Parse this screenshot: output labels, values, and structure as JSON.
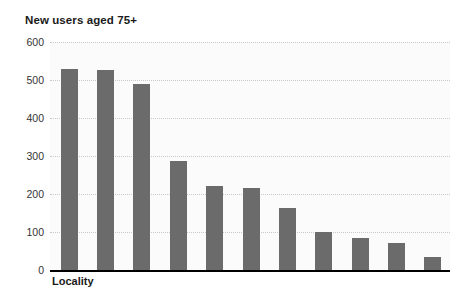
{
  "chart_data": {
    "type": "bar",
    "title": "New users aged 75+",
    "xlabel": "Locality",
    "ylabel": "",
    "categories": [
      "1",
      "2",
      "3",
      "4",
      "5",
      "6",
      "7",
      "8",
      "9",
      "10",
      "11"
    ],
    "values": [
      530,
      527,
      490,
      288,
      222,
      215,
      163,
      101,
      84,
      70,
      35
    ],
    "ylim": [
      0,
      600
    ],
    "ytick_labels": [
      "600",
      "500",
      "400",
      "300",
      "200",
      "100",
      "0"
    ],
    "ytick_values": [
      600,
      500,
      400,
      300,
      200,
      100,
      0
    ],
    "ystep": 100,
    "grid": true,
    "grid_style": "dotted-horizontal",
    "legend": "none",
    "bar_color": "#6b6b6b",
    "plot_background": "#fbfbfb",
    "axis_color": "#000000",
    "gridline_color": "#c9c9c9",
    "text_color": "#1a1a1a"
  }
}
